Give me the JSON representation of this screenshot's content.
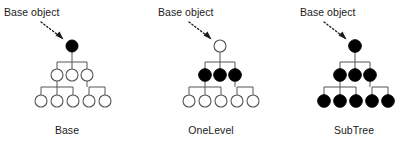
{
  "figure": {
    "width": 403,
    "height": 143,
    "background_color": "#ffffff",
    "node_fill_filled": "#000000",
    "node_fill_hollow": "#ffffff",
    "node_stroke": "#555555",
    "edge_color": "#555555",
    "text_color": "#1b1b1b",
    "annotation_label": "Base object",
    "arrow_style": "dotted-arrow"
  },
  "panels": [
    {
      "id": "base",
      "scope_label": "Base",
      "annotation_label": "Base object",
      "icon_name": "dotted-arrow-icon",
      "root": {
        "filled": true
      },
      "level2_filled": [
        false,
        false,
        false
      ],
      "level3_filled": [
        false,
        false,
        false,
        false,
        false
      ],
      "filled_count": 1,
      "total_nodes": 9
    },
    {
      "id": "onelevel",
      "scope_label": "OneLevel",
      "annotation_label": "Base object",
      "icon_name": "dotted-arrow-icon",
      "root": {
        "filled": false
      },
      "level2_filled": [
        true,
        true,
        true
      ],
      "level3_filled": [
        false,
        false,
        false,
        false,
        false
      ],
      "filled_count": 3,
      "total_nodes": 9
    },
    {
      "id": "subtree",
      "scope_label": "SubTree",
      "annotation_label": "Base object",
      "icon_name": "dotted-arrow-icon",
      "root": {
        "filled": true
      },
      "level2_filled": [
        true,
        true,
        true
      ],
      "level3_filled": [
        true,
        true,
        true,
        true,
        true
      ],
      "filled_count": 9,
      "total_nodes": 9
    }
  ]
}
